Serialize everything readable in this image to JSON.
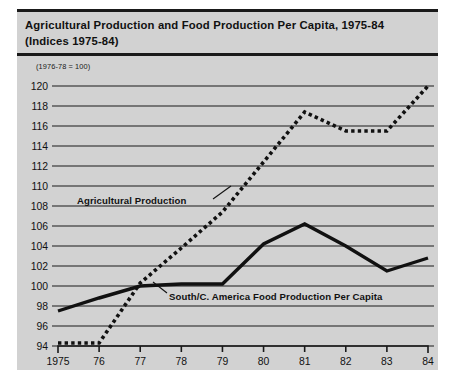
{
  "figure": {
    "title_lines": [
      "Agricultural Production and Food Production Per Capita, 1975-84",
      "(Indices 1975-84)"
    ],
    "index_note": "(1976-78 = 100)"
  },
  "chart_data": {
    "type": "line",
    "title": "Agricultural Production and Food Production Per Capita, 1975-84 (Indices 1975-84)",
    "subtitle": "(1976-78 = 100)",
    "xlabel": "",
    "ylabel": "",
    "categories": [
      "1975",
      "76",
      "77",
      "78",
      "79",
      "80",
      "81",
      "82",
      "83",
      "84"
    ],
    "x": [
      1975,
      1976,
      1977,
      1978,
      1979,
      1980,
      1981,
      1982,
      1983,
      1984
    ],
    "ylim": [
      94,
      120
    ],
    "yticks": [
      94,
      96,
      98,
      100,
      102,
      104,
      106,
      108,
      110,
      112,
      114,
      116,
      118,
      120
    ],
    "grid": true,
    "legend": "inline-annotations",
    "series": [
      {
        "name": "Agricultural Production",
        "style": "dotted",
        "values": [
          94.3,
          94.3,
          100.3,
          103.8,
          107.4,
          112.4,
          117.4,
          115.5,
          115.5,
          120.0
        ]
      },
      {
        "name": "South/C. America Food Production Per Capita",
        "style": "solid",
        "values": [
          97.5,
          98.8,
          100.0,
          100.2,
          100.2,
          104.2,
          106.2,
          104.0,
          101.5,
          102.8
        ]
      }
    ],
    "annotations": [
      {
        "text": "Agricultural Production",
        "series": "Agricultural Production"
      },
      {
        "text": "South/C. America Food Production Per Capita",
        "series": "South/C. America Food Production Per Capita"
      }
    ]
  }
}
